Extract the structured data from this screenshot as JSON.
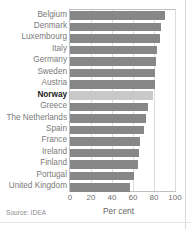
{
  "figure": {
    "title_clipped": "",
    "source": "Source: IDEA"
  },
  "chart_data": {
    "type": "bar",
    "orientation": "horizontal",
    "title": "",
    "xlabel": "Per cent",
    "ylabel": "",
    "xlim": [
      0,
      100
    ],
    "xticks": [
      "0",
      "20",
      "40",
      "60",
      "80",
      "100"
    ],
    "grid": true,
    "legend": "none",
    "highlight_category": "Norway",
    "colors": {
      "bar": "#878787",
      "bar_highlight": "#c9c9c9",
      "grid": "#dcdcdc",
      "axis": "#c0c0c0",
      "label": "#7a7a7a",
      "label_highlight": "#1a1a1a"
    },
    "categories": [
      "Belgium",
      "Denmark",
      "Luxembourg",
      "Italy",
      "Germany",
      "Sweden",
      "Austria",
      "Norway",
      "Greece",
      "The Netherlands",
      "Spain",
      "France",
      "Ireland",
      "Finland",
      "Portugal",
      "United Kingdom"
    ],
    "values": [
      90,
      87,
      86,
      83,
      82,
      81,
      81,
      79,
      74,
      72,
      70,
      67,
      66,
      65,
      61,
      57
    ]
  }
}
